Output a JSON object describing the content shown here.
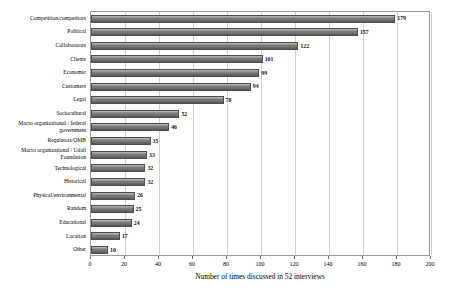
{
  "chart_data": {
    "type": "bar",
    "orientation": "horizontal",
    "title": "",
    "xlabel": "Number of times discussed in 52 interviews",
    "ylabel": "",
    "xlim": [
      0,
      200
    ],
    "xticks": [
      0,
      20,
      40,
      60,
      80,
      100,
      120,
      140,
      160,
      180,
      200
    ],
    "grid": "vertical",
    "legend": "none",
    "bar_color": "#7d7d7d",
    "categories": [
      "Competition/competitors",
      "Political",
      "Collaborators",
      "Clients",
      "Economic",
      "Customers",
      "Legal",
      "Sociocultural",
      "Macro organizational / federal government",
      "Regulators/OMB",
      "Macro organizational / Udall Foundation",
      "Technological",
      "Historical",
      "Physical/environmental",
      "Random",
      "Educational",
      "Location",
      "Other"
    ],
    "values": [
      179,
      157,
      122,
      101,
      99,
      94,
      78,
      52,
      46,
      35,
      33,
      32,
      32,
      26,
      25,
      24,
      17,
      10
    ],
    "data_labels": [
      "179",
      "157",
      "122",
      "101",
      "99",
      "94",
      "78",
      "52",
      "46",
      "35",
      "33",
      "32",
      "32",
      "26",
      "25",
      "24",
      "17",
      "10"
    ]
  },
  "axis": {
    "x_tick_labels": [
      "0",
      "20",
      "40",
      "60",
      "80",
      "100",
      "120",
      "140",
      "160",
      "180",
      "200"
    ],
    "x_title": "Number of times discussed in 52 interviews"
  }
}
